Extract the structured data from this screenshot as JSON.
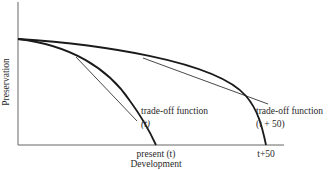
{
  "diagram": {
    "type": "production-possibility / trade-off frontier",
    "axes": {
      "x_label": "Development",
      "y_label": "Preservation"
    },
    "curves": [
      {
        "name": "trade-off-function-t",
        "label_line1": "trade-off function",
        "label_line2": "(t)",
        "x_intercept_label": "present (t)"
      },
      {
        "name": "trade-off-function-t-plus-50",
        "label_line1": "trade-off function",
        "label_line2": "(t + 50)",
        "x_intercept_label": "t+50"
      }
    ],
    "colors": {
      "line": "#1a1a1a",
      "axis": "#555555",
      "text": "#2a2a2a",
      "background": "#ffffff"
    }
  }
}
